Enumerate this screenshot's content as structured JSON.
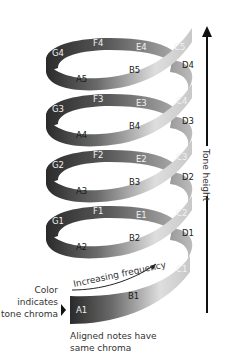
{
  "diagram": {
    "axis_label": "Tone height",
    "frequency_label": "Increasing frequency",
    "color_caption": [
      "Color",
      "indicates",
      "tone chroma"
    ],
    "aligned_caption": [
      "Aligned notes have",
      "same chroma"
    ],
    "colors": {
      "dark": "#2a2a2a",
      "light": "#e6e6e6",
      "axis": "#111111",
      "text": "#333333"
    },
    "coils": [
      {
        "level": 1,
        "notes": {
          "A": "A1",
          "B": "B1",
          "C": "C1",
          "D": "D1",
          "E": "E1",
          "F": "F1",
          "G": "G1"
        }
      },
      {
        "level": 2,
        "notes": {
          "A": "A2",
          "B": "B2",
          "C": "C2",
          "D": "D2",
          "E": "E2",
          "F": "F2",
          "G": "G2"
        }
      },
      {
        "level": 3,
        "notes": {
          "A": "A3",
          "B": "B3",
          "C": "C3",
          "D": "D3",
          "E": "E3",
          "F": "F3",
          "G": "G3"
        }
      },
      {
        "level": 4,
        "notes": {
          "A": "A4",
          "B": "B4",
          "C": "C4",
          "D": "D4",
          "E": "E4",
          "F": "F4",
          "G": "G4"
        }
      },
      {
        "level": 5,
        "notes": {
          "A": "A5",
          "B": "B5",
          "C": "C5"
        }
      }
    ],
    "labels": [
      {
        "id": "A1",
        "x": 76,
        "y": 313,
        "tone": "light"
      },
      {
        "id": "B1",
        "x": 128,
        "y": 299,
        "tone": "dark"
      },
      {
        "id": "C1",
        "x": 176,
        "y": 272,
        "tone": "light"
      },
      {
        "id": "D1",
        "x": 182,
        "y": 236,
        "tone": "dark"
      },
      {
        "id": "E1",
        "x": 136,
        "y": 218,
        "tone": "light"
      },
      {
        "id": "F1",
        "x": 93,
        "y": 214,
        "tone": "light"
      },
      {
        "id": "G1",
        "x": 52,
        "y": 224,
        "tone": "light"
      },
      {
        "id": "A2",
        "x": 76,
        "y": 250,
        "tone": "dark"
      },
      {
        "id": "B2",
        "x": 129,
        "y": 241,
        "tone": "dark"
      },
      {
        "id": "C2",
        "x": 176,
        "y": 216,
        "tone": "light"
      },
      {
        "id": "D2",
        "x": 182,
        "y": 180,
        "tone": "dark"
      },
      {
        "id": "E2",
        "x": 136,
        "y": 162,
        "tone": "light"
      },
      {
        "id": "F2",
        "x": 93,
        "y": 158,
        "tone": "light"
      },
      {
        "id": "G2",
        "x": 52,
        "y": 168,
        "tone": "light"
      },
      {
        "id": "A3",
        "x": 76,
        "y": 194,
        "tone": "dark"
      },
      {
        "id": "B3",
        "x": 129,
        "y": 185,
        "tone": "dark"
      },
      {
        "id": "C3",
        "x": 176,
        "y": 160,
        "tone": "light"
      },
      {
        "id": "D3",
        "x": 182,
        "y": 124,
        "tone": "dark"
      },
      {
        "id": "E3",
        "x": 136,
        "y": 106,
        "tone": "light"
      },
      {
        "id": "F3",
        "x": 93,
        "y": 102,
        "tone": "light"
      },
      {
        "id": "G3",
        "x": 52,
        "y": 112,
        "tone": "light"
      },
      {
        "id": "A4",
        "x": 76,
        "y": 138,
        "tone": "dark"
      },
      {
        "id": "B4",
        "x": 129,
        "y": 129,
        "tone": "dark"
      },
      {
        "id": "C4",
        "x": 176,
        "y": 104,
        "tone": "light"
      },
      {
        "id": "D4",
        "x": 182,
        "y": 68,
        "tone": "dark"
      },
      {
        "id": "E4",
        "x": 136,
        "y": 50,
        "tone": "light"
      },
      {
        "id": "F4",
        "x": 93,
        "y": 46,
        "tone": "light"
      },
      {
        "id": "G4",
        "x": 52,
        "y": 56,
        "tone": "light"
      },
      {
        "id": "A5",
        "x": 76,
        "y": 82,
        "tone": "dark"
      },
      {
        "id": "B5",
        "x": 129,
        "y": 73,
        "tone": "dark"
      },
      {
        "id": "C5",
        "x": 174,
        "y": 50,
        "tone": "light"
      }
    ]
  }
}
